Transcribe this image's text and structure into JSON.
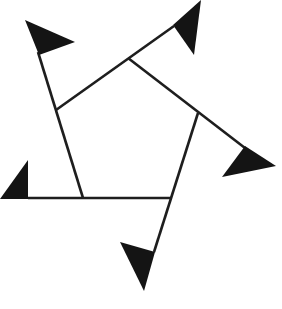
{
  "diagram": {
    "type": "pinwheel-pentagon",
    "colors": {
      "line": "#1e1e1e",
      "flag": "#141414",
      "background": "#ffffff"
    },
    "pentagon_vertices": [
      [
        56,
        110
      ],
      [
        128,
        58
      ],
      [
        198,
        113
      ],
      [
        172,
        198
      ],
      [
        83,
        198
      ]
    ],
    "arms": [
      {
        "id": "arm-1",
        "from": [
          83,
          198
        ],
        "to": [
          38,
          52
        ],
        "flag": [
          [
            25,
            20
          ],
          [
            75,
            42
          ],
          [
            39,
            55
          ]
        ]
      },
      {
        "id": "arm-2",
        "from": [
          56,
          110
        ],
        "to": [
          174,
          26
        ],
        "flag": [
          [
            201,
            0
          ],
          [
            173,
            25
          ],
          [
            194,
            55
          ]
        ]
      },
      {
        "id": "arm-3",
        "from": [
          128,
          58
        ],
        "to": [
          245,
          148
        ],
        "flag": [
          [
            245,
            146
          ],
          [
            222,
            177
          ],
          [
            276,
            166
          ]
        ]
      },
      {
        "id": "arm-4",
        "from": [
          198,
          113
        ],
        "to": [
          154,
          252
        ],
        "flag": [
          [
            120,
            242
          ],
          [
            155,
            252
          ],
          [
            144,
            291
          ]
        ]
      },
      {
        "id": "arm-5",
        "from": [
          172,
          198
        ],
        "to": [
          28,
          198
        ],
        "flag": [
          [
            0,
            199
          ],
          [
            28,
            160
          ],
          [
            28,
            199
          ]
        ]
      }
    ]
  }
}
